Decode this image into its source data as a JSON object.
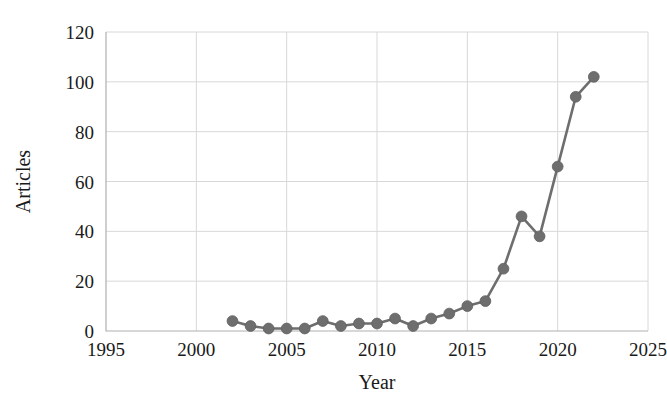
{
  "chart_data": {
    "type": "line",
    "title": "",
    "subtitle": "",
    "xlabel": "Year",
    "ylabel": "Articles",
    "xlim": [
      1995,
      2025
    ],
    "ylim": [
      0,
      120
    ],
    "xticks": [
      1995,
      2000,
      2005,
      2010,
      2015,
      2020,
      2025
    ],
    "yticks": [
      0,
      20,
      40,
      60,
      80,
      100,
      120
    ],
    "grid": true,
    "legend": null,
    "legend_position": "none",
    "series": [
      {
        "name": "Articles",
        "color": "#6e6e6e",
        "marker": "circle",
        "x": [
          2002,
          2003,
          2004,
          2005,
          2006,
          2007,
          2008,
          2009,
          2010,
          2011,
          2012,
          2013,
          2014,
          2015,
          2016,
          2017,
          2018,
          2019,
          2020,
          2021,
          2022
        ],
        "values": [
          4,
          2,
          1,
          1,
          1,
          4,
          2,
          3,
          3,
          5,
          2,
          5,
          7,
          10,
          12,
          25,
          46,
          38,
          66,
          94,
          102
        ]
      }
    ]
  },
  "axes": {
    "x_tick_labels": [
      "1995",
      "2000",
      "2005",
      "2010",
      "2015",
      "2020",
      "2025"
    ],
    "y_tick_labels": [
      "0",
      "20",
      "40",
      "60",
      "80",
      "100",
      "120"
    ],
    "x_axis_title": "Year",
    "y_axis_title": "Articles"
  },
  "colors": {
    "series": "#6e6e6e",
    "grid": "#d8d8d8",
    "axis": "#b0b0b0",
    "text": "#1a1a1a",
    "background": "#ffffff"
  }
}
